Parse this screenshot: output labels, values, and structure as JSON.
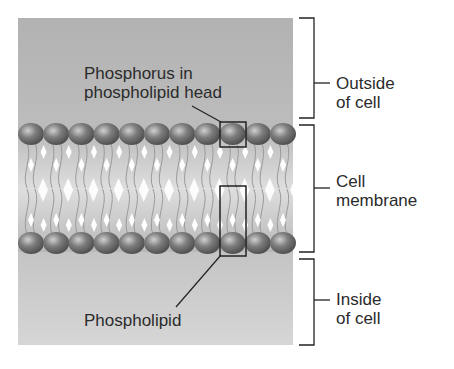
{
  "figure": {
    "labels": {
      "phosphorus": [
        "Phosphorus in",
        "phospholipid head"
      ],
      "phospholipid": "Phospholipid",
      "outside": [
        "Outside",
        "of cell"
      ],
      "membrane": [
        "Cell",
        "membrane"
      ],
      "inside": [
        "Inside",
        "of cell"
      ]
    },
    "regions": [
      {
        "name": "Outside of cell",
        "color": "#b4b4b4"
      },
      {
        "name": "Cell membrane",
        "color": "#c8c8c8"
      },
      {
        "name": "Inside of cell",
        "color": "#cfcfcf"
      }
    ],
    "heads_per_row": 11,
    "colors": {
      "head": "#6e6e6e",
      "head_highlight": "#c9c9c9",
      "tail": "#9a9a9a",
      "line": "#222222"
    }
  }
}
